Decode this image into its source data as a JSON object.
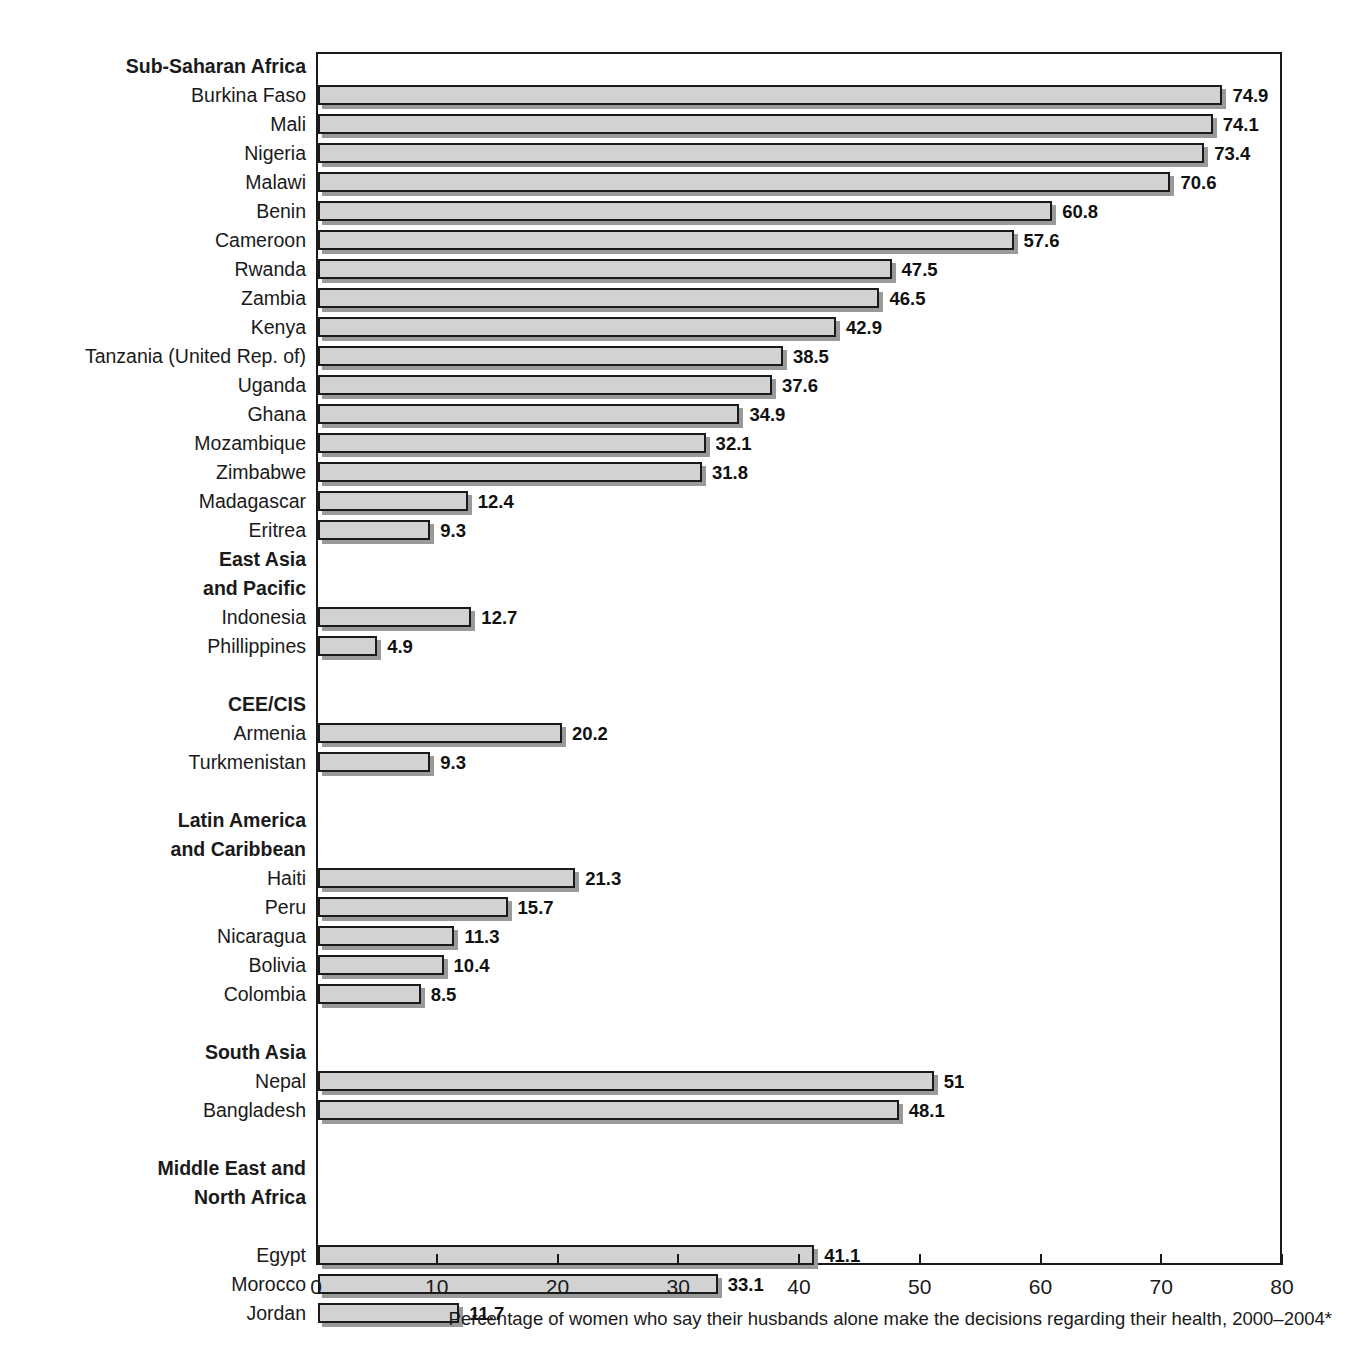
{
  "chart_data": {
    "type": "bar",
    "orientation": "horizontal",
    "title": "",
    "xlabel": "Percentage of women who say their husbands alone make the decisions regarding their health, 2000–2004*",
    "ylabel": "",
    "xlim": [
      0,
      80
    ],
    "xticks": [
      0,
      10,
      20,
      30,
      40,
      50,
      60,
      70,
      80
    ],
    "xtick_labels": [
      "0",
      "10",
      "20",
      "30",
      "40",
      "50",
      "60",
      "70",
      "80"
    ],
    "grid": false,
    "legend": false,
    "bar_color": "#d2d2d2",
    "bar_border_color": "#1a1a1a",
    "shadow_color": "#9a9a9a",
    "categories": [
      "Burkina Faso",
      "Mali",
      "Nigeria",
      "Malawi",
      "Benin",
      "Cameroon",
      "Rwanda",
      "Zambia",
      "Kenya",
      "Tanzania (United Rep. of)",
      "Uganda",
      "Ghana",
      "Mozambique",
      "Zimbabwe",
      "Madagascar",
      "Eritrea",
      "Indonesia",
      "Phillippines",
      "Armenia",
      "Turkmenistan",
      "Haiti",
      "Peru",
      "Nicaragua",
      "Bolivia",
      "Colombia",
      "Nepal",
      "Bangladesh",
      "Egypt",
      "Morocco",
      "Jordan"
    ],
    "values": [
      74.9,
      74.1,
      73.4,
      70.6,
      60.8,
      57.6,
      47.5,
      46.5,
      42.9,
      38.5,
      37.6,
      34.9,
      32.1,
      31.8,
      12.4,
      9.3,
      12.7,
      4.9,
      20.2,
      9.3,
      21.3,
      15.7,
      11.3,
      10.4,
      8.5,
      51,
      48.1,
      41.1,
      33.1,
      11.7
    ],
    "value_labels": [
      "74.9",
      "74.1",
      "73.4",
      "70.6",
      "60.8",
      "57.6",
      "47.5",
      "46.5",
      "42.9",
      "38.5",
      "37.6",
      "34.9",
      "32.1",
      "31.8",
      "12.4",
      "9.3",
      "12.7",
      "4.9",
      "20.2",
      "9.3",
      "21.3",
      "15.7",
      "11.3",
      "10.4",
      "8.5",
      "51",
      "48.1",
      "41.1",
      "33.1",
      "11.7"
    ],
    "groups": [
      {
        "name": "Sub-Saharan Africa",
        "lines": [
          "Sub-Saharan Africa"
        ],
        "members": [
          "Burkina Faso",
          "Mali",
          "Nigeria",
          "Malawi",
          "Benin",
          "Cameroon",
          "Rwanda",
          "Zambia",
          "Kenya",
          "Tanzania (United Rep. of)",
          "Uganda",
          "Ghana",
          "Mozambique",
          "Zimbabwe",
          "Madagascar",
          "Eritrea"
        ]
      },
      {
        "name": "East Asia and Pacific",
        "lines": [
          "East Asia",
          "and Pacific"
        ],
        "members": [
          "Indonesia",
          "Phillippines"
        ]
      },
      {
        "name": "CEE/CIS",
        "lines": [
          "CEE/CIS"
        ],
        "members": [
          "Armenia",
          "Turkmenistan"
        ]
      },
      {
        "name": "Latin America and Caribbean",
        "lines": [
          "Latin America",
          "and Caribbean"
        ],
        "members": [
          "Haiti",
          "Peru",
          "Nicaragua",
          "Bolivia",
          "Colombia"
        ]
      },
      {
        "name": "South Asia",
        "lines": [
          "South Asia"
        ],
        "members": [
          "Nepal",
          "Bangladesh"
        ]
      },
      {
        "name": "Middle East and North Africa",
        "lines": [
          "Middle East and",
          "North Africa"
        ],
        "members": [
          "Egypt",
          "Morocco",
          "Jordan"
        ]
      }
    ]
  },
  "rows": [
    {
      "kind": "group",
      "label": "Sub-Saharan Africa"
    },
    {
      "kind": "bar",
      "label": "Burkina Faso",
      "value": 74.9,
      "value_label": "74.9"
    },
    {
      "kind": "bar",
      "label": "Mali",
      "value": 74.1,
      "value_label": "74.1"
    },
    {
      "kind": "bar",
      "label": "Nigeria",
      "value": 73.4,
      "value_label": "73.4"
    },
    {
      "kind": "bar",
      "label": "Malawi",
      "value": 70.6,
      "value_label": "70.6"
    },
    {
      "kind": "bar",
      "label": "Benin",
      "value": 60.8,
      "value_label": "60.8"
    },
    {
      "kind": "bar",
      "label": "Cameroon",
      "value": 57.6,
      "value_label": "57.6"
    },
    {
      "kind": "bar",
      "label": "Rwanda",
      "value": 47.5,
      "value_label": "47.5"
    },
    {
      "kind": "bar",
      "label": "Zambia",
      "value": 46.5,
      "value_label": "46.5"
    },
    {
      "kind": "bar",
      "label": "Kenya",
      "value": 42.9,
      "value_label": "42.9"
    },
    {
      "kind": "bar",
      "label": "Tanzania (United Rep. of)",
      "value": 38.5,
      "value_label": "38.5"
    },
    {
      "kind": "bar",
      "label": "Uganda",
      "value": 37.6,
      "value_label": "37.6"
    },
    {
      "kind": "bar",
      "label": "Ghana",
      "value": 34.9,
      "value_label": "34.9"
    },
    {
      "kind": "bar",
      "label": "Mozambique",
      "value": 32.1,
      "value_label": "32.1"
    },
    {
      "kind": "bar",
      "label": "Zimbabwe",
      "value": 31.8,
      "value_label": "31.8"
    },
    {
      "kind": "bar",
      "label": "Madagascar",
      "value": 12.4,
      "value_label": "12.4"
    },
    {
      "kind": "bar",
      "label": "Eritrea",
      "value": 9.3,
      "value_label": "9.3"
    },
    {
      "kind": "group",
      "label": "East Asia"
    },
    {
      "kind": "group",
      "label": "and Pacific"
    },
    {
      "kind": "bar",
      "label": "Indonesia",
      "value": 12.7,
      "value_label": "12.7"
    },
    {
      "kind": "bar",
      "label": "Phillippines",
      "value": 4.9,
      "value_label": "4.9"
    },
    {
      "kind": "spacer",
      "label": ""
    },
    {
      "kind": "group",
      "label": "CEE/CIS"
    },
    {
      "kind": "bar",
      "label": "Armenia",
      "value": 20.2,
      "value_label": "20.2"
    },
    {
      "kind": "bar",
      "label": "Turkmenistan",
      "value": 9.3,
      "value_label": "9.3"
    },
    {
      "kind": "spacer",
      "label": ""
    },
    {
      "kind": "group",
      "label": "Latin America"
    },
    {
      "kind": "group",
      "label": "and Caribbean"
    },
    {
      "kind": "bar",
      "label": "Haiti",
      "value": 21.3,
      "value_label": "21.3"
    },
    {
      "kind": "bar",
      "label": "Peru",
      "value": 15.7,
      "value_label": "15.7"
    },
    {
      "kind": "bar",
      "label": "Nicaragua",
      "value": 11.3,
      "value_label": "11.3"
    },
    {
      "kind": "bar",
      "label": "Bolivia",
      "value": 10.4,
      "value_label": "10.4"
    },
    {
      "kind": "bar",
      "label": "Colombia",
      "value": 8.5,
      "value_label": "8.5"
    },
    {
      "kind": "spacer",
      "label": ""
    },
    {
      "kind": "group",
      "label": "South Asia"
    },
    {
      "kind": "bar",
      "label": "Nepal",
      "value": 51,
      "value_label": "51"
    },
    {
      "kind": "bar",
      "label": "Bangladesh",
      "value": 48.1,
      "value_label": "48.1"
    },
    {
      "kind": "spacer",
      "label": ""
    },
    {
      "kind": "group",
      "label": "Middle East and"
    },
    {
      "kind": "group",
      "label": "North Africa"
    },
    {
      "kind": "spacer",
      "label": ""
    },
    {
      "kind": "bar",
      "label": "Egypt",
      "value": 41.1,
      "value_label": "41.1"
    },
    {
      "kind": "bar",
      "label": "Morocco",
      "value": 33.1,
      "value_label": "33.1"
    },
    {
      "kind": "bar",
      "label": "Jordan",
      "value": 11.7,
      "value_label": "11.7"
    }
  ],
  "axis": {
    "caption": "Percentage of women who say their husbands alone make the decisions regarding their health, 2000–2004*",
    "ticks": [
      "0",
      "10",
      "20",
      "30",
      "40",
      "50",
      "60",
      "70",
      "80"
    ]
  }
}
